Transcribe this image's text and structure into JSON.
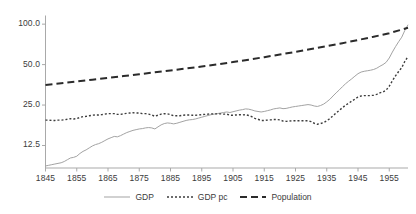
{
  "chart_data": {
    "type": "line",
    "title": "",
    "xlabel": "",
    "ylabel": "",
    "yscale": "log",
    "ylim": [
      8.5,
      115
    ],
    "xlim": [
      1845,
      1961
    ],
    "grid": false,
    "legend_position": "bottom-center",
    "yticks": [
      {
        "value": 100.0,
        "label": "100.0"
      },
      {
        "value": 50.0,
        "label": "50.0"
      },
      {
        "value": 25.0,
        "label": "25.0"
      },
      {
        "value": 12.5,
        "label": "12.5"
      }
    ],
    "xticks": [
      {
        "value": 1845,
        "label": "1845"
      },
      {
        "value": 1855,
        "label": "1855"
      },
      {
        "value": 1865,
        "label": "1865"
      },
      {
        "value": 1875,
        "label": "1875"
      },
      {
        "value": 1885,
        "label": "1885"
      },
      {
        "value": 1895,
        "label": "1895"
      },
      {
        "value": 1905,
        "label": "1905"
      },
      {
        "value": 1915,
        "label": "1915"
      },
      {
        "value": 1925,
        "label": "1925"
      },
      {
        "value": 1935,
        "label": "1935"
      },
      {
        "value": 1945,
        "label": "1945"
      },
      {
        "value": 1955,
        "label": "1955"
      }
    ],
    "colors": {
      "gdp": "#a3a3a3",
      "gdp_pc": "#3d3d3d",
      "population": "#2b2b2b",
      "axis": "#a9a9a9",
      "text": "#3b3b3b"
    },
    "series": [
      {
        "name": "GDP",
        "style": "solid",
        "color": "#a3a3a3",
        "x": [
          1845,
          1846,
          1847,
          1848,
          1849,
          1850,
          1851,
          1852,
          1853,
          1854,
          1855,
          1856,
          1857,
          1858,
          1859,
          1860,
          1861,
          1862,
          1863,
          1864,
          1865,
          1866,
          1867,
          1868,
          1869,
          1870,
          1871,
          1872,
          1873,
          1874,
          1875,
          1876,
          1877,
          1878,
          1879,
          1880,
          1881,
          1882,
          1883,
          1884,
          1885,
          1886,
          1887,
          1888,
          1889,
          1890,
          1891,
          1892,
          1893,
          1894,
          1895,
          1896,
          1897,
          1898,
          1899,
          1900,
          1901,
          1902,
          1903,
          1904,
          1905,
          1906,
          1907,
          1908,
          1909,
          1910,
          1911,
          1912,
          1913,
          1914,
          1915,
          1916,
          1917,
          1918,
          1919,
          1920,
          1921,
          1922,
          1923,
          1924,
          1925,
          1926,
          1927,
          1928,
          1929,
          1930,
          1931,
          1932,
          1933,
          1934,
          1935,
          1936,
          1937,
          1938,
          1939,
          1940,
          1941,
          1942,
          1943,
          1944,
          1945,
          1946,
          1947,
          1948,
          1949,
          1950,
          1951,
          1952,
          1953,
          1954,
          1955,
          1956,
          1957,
          1958,
          1959,
          1960,
          1961
        ],
        "values": [
          8.8,
          8.9,
          9.0,
          9.1,
          9.2,
          9.3,
          9.5,
          9.8,
          10.1,
          10.2,
          10.4,
          10.9,
          11.3,
          11.6,
          12.0,
          12.4,
          12.7,
          12.9,
          13.2,
          13.6,
          14.0,
          14.3,
          14.6,
          14.5,
          14.8,
          15.2,
          15.6,
          15.9,
          16.2,
          16.4,
          16.6,
          16.7,
          16.9,
          17.0,
          16.9,
          16.6,
          17.2,
          17.8,
          18.2,
          18.4,
          18.3,
          18.1,
          18.3,
          18.6,
          18.9,
          19.2,
          19.4,
          19.5,
          19.7,
          20.0,
          20.3,
          20.6,
          20.9,
          21.2,
          21.4,
          21.6,
          21.8,
          22.0,
          22.2,
          22.0,
          22.3,
          22.6,
          22.9,
          23.1,
          23.4,
          23.3,
          23.0,
          22.6,
          22.4,
          22.2,
          22.4,
          22.7,
          23.0,
          23.4,
          23.6,
          23.8,
          23.5,
          23.6,
          23.9,
          24.2,
          24.4,
          24.6,
          24.8,
          25.0,
          25.2,
          25.0,
          24.6,
          24.4,
          24.8,
          25.4,
          26.4,
          27.6,
          29.2,
          30.8,
          32.4,
          34.2,
          36.0,
          37.6,
          39.2,
          41.0,
          42.8,
          44.0,
          44.6,
          45.0,
          45.4,
          46.0,
          47.0,
          48.6,
          50.0,
          52.0,
          56.0,
          62.0,
          68.0,
          74.0,
          80.0,
          90.0,
          99.0
        ]
      },
      {
        "name": "GDP pc",
        "style": "dotted",
        "color": "#3d3d3d",
        "x": [
          1845,
          1846,
          1847,
          1848,
          1849,
          1850,
          1851,
          1852,
          1853,
          1854,
          1855,
          1856,
          1857,
          1858,
          1859,
          1860,
          1861,
          1862,
          1863,
          1864,
          1865,
          1866,
          1867,
          1868,
          1869,
          1870,
          1871,
          1872,
          1873,
          1874,
          1875,
          1876,
          1877,
          1878,
          1879,
          1880,
          1881,
          1882,
          1883,
          1884,
          1885,
          1886,
          1887,
          1888,
          1889,
          1890,
          1891,
          1892,
          1893,
          1894,
          1895,
          1896,
          1897,
          1898,
          1899,
          1900,
          1901,
          1902,
          1903,
          1904,
          1905,
          1906,
          1907,
          1908,
          1909,
          1910,
          1911,
          1912,
          1913,
          1914,
          1915,
          1916,
          1917,
          1918,
          1919,
          1920,
          1921,
          1922,
          1923,
          1924,
          1925,
          1926,
          1927,
          1928,
          1929,
          1930,
          1931,
          1932,
          1933,
          1934,
          1935,
          1936,
          1937,
          1938,
          1939,
          1940,
          1941,
          1942,
          1943,
          1944,
          1945,
          1946,
          1947,
          1948,
          1949,
          1950,
          1951,
          1952,
          1953,
          1954,
          1955,
          1956,
          1957,
          1958,
          1959,
          1960,
          1961
        ],
        "values": [
          19.3,
          19.3,
          19.2,
          19.2,
          19.3,
          19.3,
          19.4,
          19.6,
          19.8,
          19.7,
          19.8,
          20.2,
          20.5,
          20.6,
          20.8,
          21.0,
          21.1,
          21.1,
          21.2,
          21.4,
          21.6,
          21.6,
          21.6,
          21.3,
          21.3,
          21.5,
          21.7,
          21.8,
          21.9,
          21.8,
          21.8,
          21.6,
          21.6,
          21.4,
          21.1,
          20.6,
          21.0,
          21.4,
          21.6,
          21.5,
          21.2,
          20.8,
          20.8,
          20.8,
          21.0,
          21.1,
          21.1,
          21.0,
          21.0,
          21.1,
          21.2,
          21.3,
          21.4,
          21.5,
          21.5,
          21.5,
          21.5,
          21.4,
          21.4,
          21.0,
          21.0,
          21.1,
          21.2,
          21.1,
          21.2,
          20.9,
          20.5,
          19.9,
          19.6,
          19.2,
          19.2,
          19.3,
          19.4,
          19.5,
          19.5,
          19.4,
          19.0,
          18.9,
          19.0,
          19.1,
          19.1,
          19.1,
          19.1,
          19.1,
          19.1,
          18.8,
          18.3,
          18.0,
          18.2,
          18.5,
          19.1,
          19.8,
          20.8,
          21.8,
          22.8,
          23.9,
          24.9,
          25.8,
          26.7,
          27.7,
          28.7,
          29.2,
          29.4,
          29.4,
          29.4,
          29.6,
          30.0,
          30.8,
          31.3,
          32.3,
          34.5,
          37.9,
          41.2,
          44.4,
          47.5,
          52.9,
          57.5
        ]
      },
      {
        "name": "Population",
        "style": "dashed",
        "color": "#2b2b2b",
        "x": [
          1845,
          1850,
          1855,
          1860,
          1865,
          1870,
          1875,
          1880,
          1885,
          1890,
          1895,
          1900,
          1905,
          1910,
          1915,
          1920,
          1925,
          1930,
          1935,
          1940,
          1945,
          1950,
          1955,
          1961
        ],
        "values": [
          35.2,
          36.3,
          37.4,
          38.6,
          39.8,
          41.1,
          42.4,
          43.8,
          45.2,
          46.8,
          48.4,
          50.2,
          52.2,
          54.4,
          56.8,
          59.4,
          62.2,
          65.3,
          68.6,
          72.2,
          76.2,
          80.6,
          85.6,
          94.0
        ]
      }
    ]
  },
  "legend": {
    "items": [
      {
        "label": "GDP",
        "style": "solid",
        "color": "#a3a3a3"
      },
      {
        "label": "GDP pc",
        "style": "dotted",
        "color": "#3d3d3d"
      },
      {
        "label": "Population",
        "style": "dashed",
        "color": "#2b2b2b"
      }
    ]
  }
}
